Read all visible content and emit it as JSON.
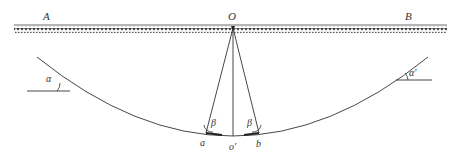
{
  "diagram": {
    "labels": {
      "A": "A",
      "B": "B",
      "O": "O",
      "alpha_left": "α",
      "alpha_right": "α'",
      "beta_left": "β",
      "beta_right": "β",
      "a": "a",
      "o_prime": "o'",
      "b": "b"
    },
    "colors": {
      "line": "#333333",
      "hatch": "#444444",
      "background": "#ffffff"
    },
    "elements": {
      "support_beam": "hatched horizontal support A–B",
      "cable_curve": "sagging curve between two supports",
      "ray_Oa": "line from O to a",
      "ray_Oo": "vertical line from O to o'",
      "ray_Ob": "line from O to b"
    }
  }
}
